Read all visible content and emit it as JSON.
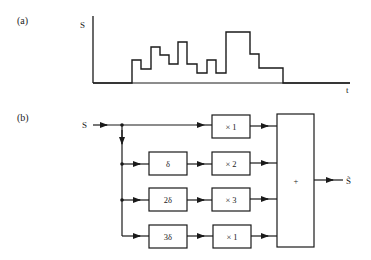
{
  "panel_a": {
    "label": "(a)",
    "y_axis_label": "S",
    "x_axis_label": "t",
    "chart_data": {
      "type": "line",
      "title": "",
      "xlabel": "t",
      "ylabel": "S",
      "step": true,
      "axes": {
        "origin": [
          93,
          83
        ],
        "y_top": 16,
        "x_end": 350
      },
      "points": [
        [
          93,
          83
        ],
        [
          132,
          83
        ],
        [
          132,
          60
        ],
        [
          141,
          60
        ],
        [
          141,
          69
        ],
        [
          151,
          69
        ],
        [
          151,
          47
        ],
        [
          160,
          47
        ],
        [
          160,
          55
        ],
        [
          169,
          55
        ],
        [
          169,
          64
        ],
        [
          178,
          64
        ],
        [
          178,
          42
        ],
        [
          187,
          42
        ],
        [
          187,
          64
        ],
        [
          197,
          64
        ],
        [
          197,
          73
        ],
        [
          207,
          73
        ],
        [
          207,
          60
        ],
        [
          216,
          60
        ],
        [
          216,
          73
        ],
        [
          226,
          73
        ],
        [
          226,
          32
        ],
        [
          250,
          32
        ],
        [
          250,
          54
        ],
        [
          259,
          54
        ],
        [
          259,
          68
        ],
        [
          283,
          68
        ],
        [
          283,
          83
        ],
        [
          350,
          83
        ]
      ]
    }
  },
  "panel_b": {
    "label": "(b)",
    "input_label": "S",
    "output_label": "S̃",
    "delay_blocks": [
      {
        "label": "δ"
      },
      {
        "label": "2δ"
      },
      {
        "label": "3δ"
      }
    ],
    "gain_blocks": [
      {
        "label": "× 1"
      },
      {
        "label": "× 2"
      },
      {
        "label": "× 3"
      },
      {
        "label": "× 1"
      }
    ],
    "sum_block": {
      "label": "+"
    }
  }
}
